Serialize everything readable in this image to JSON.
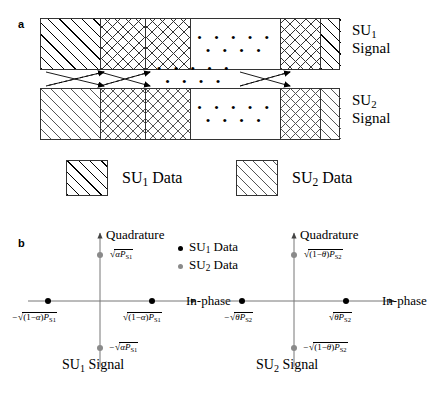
{
  "figure": {
    "panels": [
      {
        "letter": "a"
      },
      {
        "letter": "b"
      }
    ]
  },
  "panel_a": {
    "letter": "a",
    "rows": [
      {
        "name": "SU1-signal-row",
        "label_line1": "SU",
        "label_sub": "1",
        "label_line2": "Signal",
        "blocks": [
          {
            "type": "su1-data-diagonal"
          },
          {
            "type": "crosshatch"
          },
          {
            "type": "crosshatch"
          },
          {
            "type": "blank-ellipsis"
          },
          {
            "type": "crosshatch"
          },
          {
            "type": "su1-data-diagonal"
          }
        ],
        "ellipsis": "• • • • • • • • •"
      },
      {
        "name": "SU2-signal-row",
        "label_line1": "SU",
        "label_sub": "2",
        "label_line2": "Signal",
        "blocks": [
          {
            "type": "su2-data-diagonal"
          },
          {
            "type": "crosshatch"
          },
          {
            "type": "crosshatch"
          },
          {
            "type": "blank-ellipsis"
          },
          {
            "type": "crosshatch"
          },
          {
            "type": "su2-data-diagonal"
          }
        ],
        "ellipsis": "• • • • • • • • •"
      }
    ],
    "middle_ellipsis": "• • • • • • • • •"
  },
  "legend_blocks": {
    "items": [
      {
        "swatch": "su1-data-diagonal",
        "label_main": "SU",
        "label_sub": "1",
        "label_tail": " Data"
      },
      {
        "swatch": "su2-data-diagonal",
        "label_main": "SU",
        "label_sub": "2",
        "label_tail": " Data"
      }
    ]
  },
  "panel_b": {
    "letter": "b",
    "dot_legend": [
      {
        "color": "#000000",
        "label_main": "SU",
        "label_sub": "1",
        "label_tail": " Data"
      },
      {
        "color": "#8a8a8a",
        "label_main": "SU",
        "label_sub": "2",
        "label_tail": " Data"
      }
    ],
    "constellations": [
      {
        "name": "su1-constellation",
        "caption_main": "SU",
        "caption_sub": "1",
        "caption_tail": " Signal",
        "y_axis_label": "Quadrature",
        "x_axis_label": "In-phase",
        "points": [
          {
            "name": "quadrature-positive",
            "color": "gray",
            "label": "√(αP_S1)",
            "label_parts": {
              "sign": "",
              "inner": "α",
              "power_base": "P",
              "power_sub": "S1"
            }
          },
          {
            "name": "quadrature-negative",
            "color": "gray",
            "label": "−√(αP_S1)",
            "label_parts": {
              "sign": "−",
              "inner": "α",
              "power_base": "P",
              "power_sub": "S1"
            }
          },
          {
            "name": "inphase-negative",
            "color": "black",
            "label": "−√((1−α)P_S1)",
            "label_parts": {
              "sign": "−",
              "inner": "(1−α)",
              "power_base": "P",
              "power_sub": "S1"
            }
          },
          {
            "name": "inphase-positive",
            "color": "black",
            "label": "√((1−α)P_S1)",
            "label_parts": {
              "sign": "",
              "inner": "(1−α)",
              "power_base": "P",
              "power_sub": "S1"
            }
          }
        ]
      },
      {
        "name": "su2-constellation",
        "caption_main": "SU",
        "caption_sub": "2",
        "caption_tail": " Signal",
        "y_axis_label": "Quadrature",
        "x_axis_label": "In-phase",
        "points": [
          {
            "name": "quadrature-positive",
            "color": "gray",
            "label": "√((1−θ)P_S2)",
            "label_parts": {
              "sign": "",
              "inner": "(1−θ)",
              "power_base": "P",
              "power_sub": "S2"
            }
          },
          {
            "name": "quadrature-negative",
            "color": "gray",
            "label": "−√((1−θ)P_S2)",
            "label_parts": {
              "sign": "−",
              "inner": "(1−θ)",
              "power_base": "P",
              "power_sub": "S2"
            }
          },
          {
            "name": "inphase-negative",
            "color": "black",
            "label": "−√(θP_S2)",
            "label_parts": {
              "sign": "−",
              "inner": "θ",
              "power_base": "P",
              "power_sub": "S2"
            }
          },
          {
            "name": "inphase-positive",
            "color": "black",
            "label": "√(θP_S2)",
            "label_parts": {
              "sign": "",
              "inner": "θ",
              "power_base": "P",
              "power_sub": "S2"
            }
          }
        ]
      }
    ]
  },
  "colors": {
    "stroke": "#333333",
    "su1_dot": "#000000",
    "su2_dot": "#8a8a8a",
    "axis": "#555555"
  }
}
